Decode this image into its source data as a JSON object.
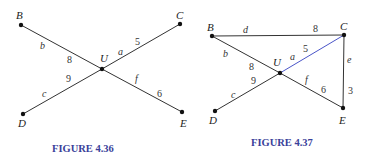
{
  "colors": {
    "edge": "#333333",
    "highlight_edge": "#4a55c8",
    "caption": "#3a3f9a",
    "node": "#111111"
  },
  "figures": [
    {
      "caption": "FIGURE 4.36",
      "vertices": [
        {
          "label": "B",
          "x": 21,
          "y": 25
        },
        {
          "label": "C",
          "x": 180,
          "y": 24
        },
        {
          "label": "U",
          "x": 102,
          "y": 69
        },
        {
          "label": "D",
          "x": 23,
          "y": 114
        },
        {
          "label": "E",
          "x": 182,
          "y": 112
        }
      ],
      "edges": [
        {
          "from": "B",
          "to": "U",
          "name": "b",
          "weight": "8"
        },
        {
          "from": "U",
          "to": "C",
          "name": "a",
          "weight": "5"
        },
        {
          "from": "D",
          "to": "U",
          "name": "c",
          "weight": "9"
        },
        {
          "from": "U",
          "to": "E",
          "name": "f",
          "weight": "6"
        }
      ]
    },
    {
      "caption": "FIGURE 4.37",
      "vertices": [
        {
          "label": "B",
          "x": 212,
          "y": 36
        },
        {
          "label": "C",
          "x": 344,
          "y": 35
        },
        {
          "label": "U",
          "x": 280,
          "y": 73
        },
        {
          "label": "D",
          "x": 215,
          "y": 111
        },
        {
          "label": "E",
          "x": 343,
          "y": 108
        }
      ],
      "edges": [
        {
          "from": "B",
          "to": "C",
          "name": "d",
          "weight": "8"
        },
        {
          "from": "B",
          "to": "U",
          "name": "b",
          "weight": "8"
        },
        {
          "from": "U",
          "to": "C",
          "name": "a",
          "weight": "5",
          "highlighted": true
        },
        {
          "from": "D",
          "to": "U",
          "name": "c",
          "weight": "9"
        },
        {
          "from": "U",
          "to": "E",
          "name": "f",
          "weight": "6"
        },
        {
          "from": "C",
          "to": "E",
          "name": "e",
          "weight": "3"
        }
      ]
    }
  ]
}
